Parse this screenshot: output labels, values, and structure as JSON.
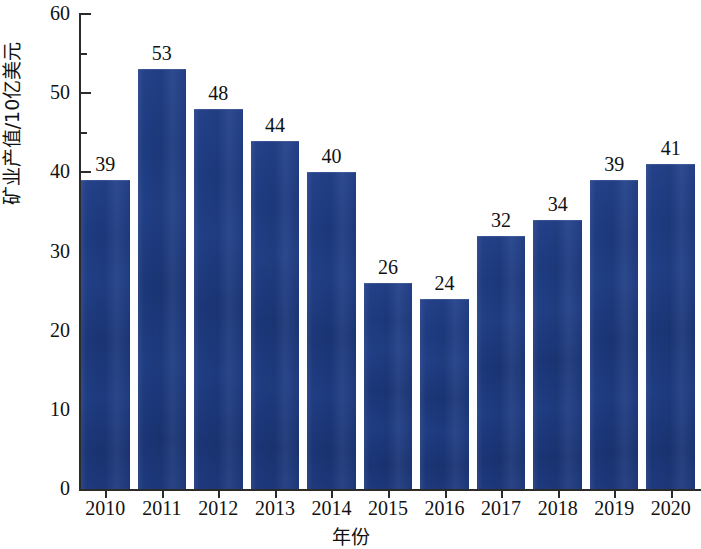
{
  "chart_data": {
    "type": "bar",
    "title": "",
    "xlabel": "年份",
    "ylabel": "矿业产值/10亿美元",
    "categories": [
      "2010",
      "2011",
      "2012",
      "2013",
      "2014",
      "2015",
      "2016",
      "2017",
      "2018",
      "2019",
      "2020"
    ],
    "values": [
      39,
      53,
      48,
      44,
      40,
      26,
      24,
      32,
      34,
      39,
      41
    ],
    "series": [
      {
        "name": "矿业产值",
        "values": [
          39,
          53,
          48,
          44,
          40,
          26,
          24,
          32,
          34,
          39,
          41
        ]
      }
    ],
    "ylim": [
      0,
      60
    ],
    "y_major_ticks": [
      "0",
      "10",
      "20",
      "30",
      "40",
      "50",
      "60"
    ],
    "y_minor_tick_interval": 5,
    "grid": false,
    "legend": "none",
    "bar_color": "#1e3d82",
    "data_labels_shown": true,
    "axis_color": "#2b2b2b"
  }
}
